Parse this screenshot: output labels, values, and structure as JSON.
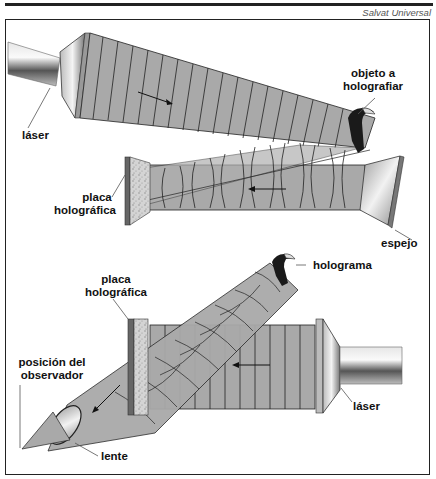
{
  "header": {
    "credit": "Salvat Universal"
  },
  "diagram": {
    "top_panel": {
      "labels": {
        "laser": "láser",
        "object_line1": "objeto a",
        "object_line2": "holografiar",
        "plate_line1": "placa",
        "plate_line2": "holográfica",
        "mirror": "espejo"
      }
    },
    "bottom_panel": {
      "labels": {
        "plate_line1": "placa",
        "plate_line2": "holográfica",
        "hologram": "holograma",
        "observer_line1": "posición del",
        "observer_line2": "observador",
        "lens": "lente",
        "laser": "láser"
      }
    },
    "colors": {
      "beam": "#a9a9a9",
      "line": "#1a1a1a",
      "tube": "#c8c8c8",
      "plate": "#d0d0d0",
      "frame": "#222222"
    }
  }
}
